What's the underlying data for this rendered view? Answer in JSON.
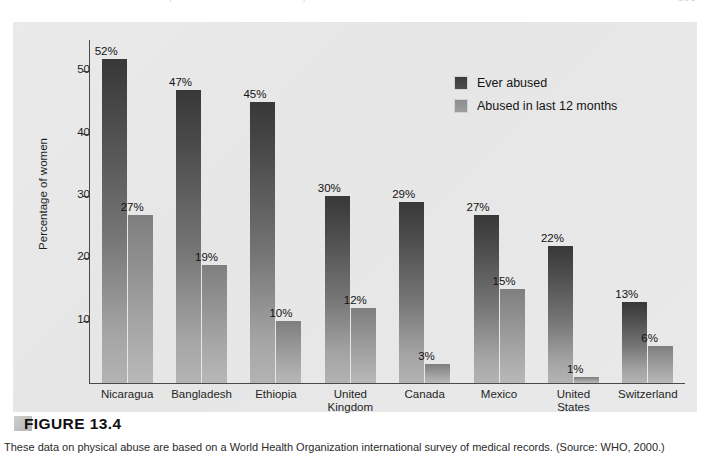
{
  "running_head": {
    "text": "Chapter 13  Gender and Sexuality",
    "page_number": "505"
  },
  "figure": {
    "label": "FIGURE 13.4",
    "caption": "These data on physical abuse are based on a World Health Organization international survey of medical records. (Source: WHO, 2000.)"
  },
  "colors": {
    "panel_bg": "#e8e8e8",
    "series_ever": "#3b3b3b",
    "series_recent": "#8e8e8e",
    "axis": "#4a4a4a",
    "text": "#1c1c1c"
  },
  "chart_data": {
    "type": "bar",
    "title": "",
    "xlabel": "",
    "ylabel": "Percentage of women",
    "ylim": [
      0,
      55
    ],
    "yticks": [
      10,
      20,
      30,
      40,
      50
    ],
    "ytick_labels": [
      "10",
      "20",
      "30",
      "40",
      "50"
    ],
    "grid": false,
    "legend_position": "upper-right-inside",
    "value_suffix": "%",
    "categories": [
      "Nicaragua",
      "Bangladesh",
      "Ethiopia",
      "United Kingdom",
      "Canada",
      "Mexico",
      "United States",
      "Switzerland"
    ],
    "category_lines": [
      [
        "Nicaragua"
      ],
      [
        "Bangladesh"
      ],
      [
        "Ethiopia"
      ],
      [
        "United",
        "Kingdom"
      ],
      [
        "Canada"
      ],
      [
        "Mexico"
      ],
      [
        "United",
        "States"
      ],
      [
        "Switzerland"
      ]
    ],
    "series": [
      {
        "name": "Ever abused",
        "values": [
          52,
          47,
          45,
          30,
          29,
          27,
          22,
          13
        ],
        "labels": [
          "52%",
          "47%",
          "45%",
          "30%",
          "29%",
          "27%",
          "22%",
          "13%"
        ]
      },
      {
        "name": "Abused in last 12 months",
        "values": [
          27,
          19,
          10,
          12,
          3,
          15,
          1,
          6
        ],
        "labels": [
          "27%",
          "19%",
          "10%",
          "12%",
          "3%",
          "15%",
          "1%",
          "6%"
        ]
      }
    ]
  }
}
